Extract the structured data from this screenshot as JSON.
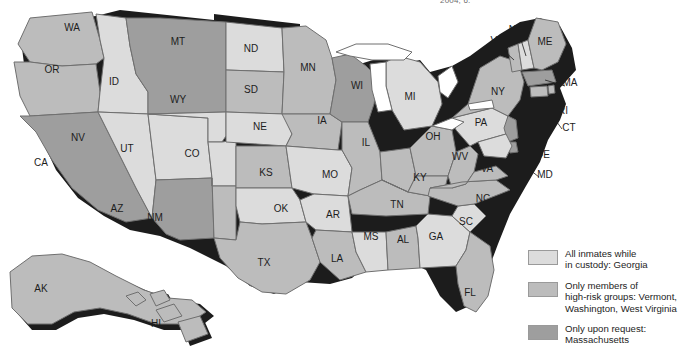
{
  "figure": {
    "caption_fragment": "2004, 6.",
    "background_color": "#ffffff"
  },
  "palette": {
    "light": "#dcdcdc",
    "medium": "#bcbcbc",
    "dark": "#9e9e9e",
    "water": "#ffffff",
    "border": "#6f6f6f",
    "shadow": "#1c1c1c",
    "label_color": "#1d1d1d"
  },
  "legend": {
    "items": [
      {
        "swatch": "#dcdcdc",
        "label": "All inmates while\nin custody: Georgia",
        "category": "all-inmates"
      },
      {
        "swatch": "#bcbcbc",
        "label": "Only members of\nhigh-risk groups: Vermont,\nWashington, West Virginia",
        "category": "high-risk-groups"
      },
      {
        "swatch": "#9e9e9e",
        "label": "Only upon request:\nMassachusetts",
        "category": "upon-request"
      }
    ]
  },
  "map": {
    "title": "United States choropleth of correctional HIV testing policy",
    "state_labels": [
      {
        "code": "WA",
        "x": 72,
        "y": 31
      },
      {
        "code": "OR",
        "x": 52,
        "y": 73
      },
      {
        "code": "CA",
        "x": 41,
        "y": 166
      },
      {
        "code": "ID",
        "x": 114,
        "y": 85
      },
      {
        "code": "NV",
        "x": 78,
        "y": 141
      },
      {
        "code": "UT",
        "x": 127,
        "y": 152
      },
      {
        "code": "AZ",
        "x": 117,
        "y": 212
      },
      {
        "code": "MT",
        "x": 178,
        "y": 45
      },
      {
        "code": "WY",
        "x": 178,
        "y": 103
      },
      {
        "code": "CO",
        "x": 192,
        "y": 157
      },
      {
        "code": "NM",
        "x": 155,
        "y": 221
      },
      {
        "code": "ND",
        "x": 251,
        "y": 52
      },
      {
        "code": "SD",
        "x": 251,
        "y": 93
      },
      {
        "code": "NE",
        "x": 260,
        "y": 130
      },
      {
        "code": "KS",
        "x": 266,
        "y": 176
      },
      {
        "code": "OK",
        "x": 281,
        "y": 212
      },
      {
        "code": "TX",
        "x": 264,
        "y": 266
      },
      {
        "code": "MN",
        "x": 308,
        "y": 71
      },
      {
        "code": "IA",
        "x": 322,
        "y": 124
      },
      {
        "code": "MO",
        "x": 330,
        "y": 178
      },
      {
        "code": "AR",
        "x": 333,
        "y": 218
      },
      {
        "code": "LA",
        "x": 337,
        "y": 262
      },
      {
        "code": "WI",
        "x": 357,
        "y": 89
      },
      {
        "code": "IL",
        "x": 366,
        "y": 146
      },
      {
        "code": "MS",
        "x": 371,
        "y": 240
      },
      {
        "code": "MI",
        "x": 410,
        "y": 100
      },
      {
        "code": "IN",
        "x": 398,
        "y": 146
      },
      {
        "code": "AL",
        "x": 403,
        "y": 243
      },
      {
        "code": "OH",
        "x": 433,
        "y": 140
      },
      {
        "code": "KY",
        "x": 420,
        "y": 181
      },
      {
        "code": "TN",
        "x": 397,
        "y": 208
      },
      {
        "code": "GA",
        "x": 436,
        "y": 240
      },
      {
        "code": "FL",
        "x": 470,
        "y": 296
      },
      {
        "code": "SC",
        "x": 466,
        "y": 225
      },
      {
        "code": "NC",
        "x": 483,
        "y": 202
      },
      {
        "code": "WV",
        "x": 460,
        "y": 160
      },
      {
        "code": "VA",
        "x": 487,
        "y": 172
      },
      {
        "code": "PA",
        "x": 481,
        "y": 126
      },
      {
        "code": "NY",
        "x": 498,
        "y": 95
      },
      {
        "code": "VT",
        "x": 497,
        "y": 44
      },
      {
        "code": "NH",
        "x": 516,
        "y": 33
      },
      {
        "code": "ME",
        "x": 545,
        "y": 45
      },
      {
        "code": "MA",
        "x": 570,
        "y": 86
      },
      {
        "code": "RI",
        "x": 563,
        "y": 114
      },
      {
        "code": "CT",
        "x": 569,
        "y": 131
      },
      {
        "code": "NJ",
        "x": 537,
        "y": 140
      },
      {
        "code": "DE",
        "x": 543,
        "y": 158
      },
      {
        "code": "MD",
        "x": 545,
        "y": 178
      },
      {
        "code": "AK",
        "x": 41,
        "y": 292
      },
      {
        "code": "HI",
        "x": 156,
        "y": 327
      }
    ],
    "highlighted_states": {
      "all-inmates": [
        "GA"
      ],
      "high-risk-groups": [
        "VT",
        "WA",
        "WV"
      ],
      "upon-request": [
        "MA"
      ]
    }
  }
}
